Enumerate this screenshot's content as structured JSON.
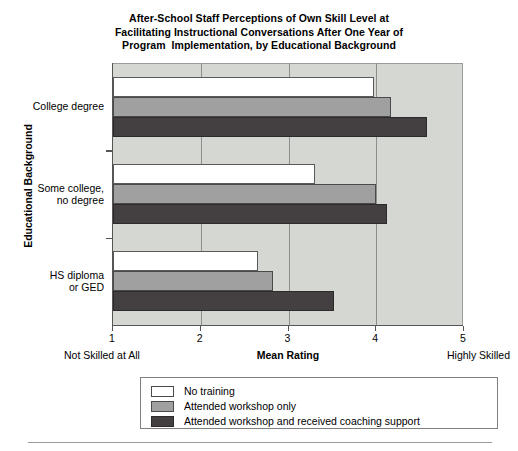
{
  "chart_data": {
    "type": "bar",
    "orientation": "horizontal",
    "title": "After-School Staff Perceptions of Own Skill Level at Facilitating Instructional Conversations After One Year of Program  Implementation, by Educational Background",
    "title_lines": [
      "After-School Staff Perceptions of Own Skill Level at",
      "Facilitating Instructional Conversations After One Year of",
      "Program  Implementation, by Educational Background"
    ],
    "xlabel": "Mean Rating",
    "ylabel": "Educational Background",
    "xlim": [
      1,
      5
    ],
    "xticks": [
      1,
      2,
      3,
      4,
      5
    ],
    "xtick_labels": [
      "1",
      "2",
      "3",
      "4",
      "5"
    ],
    "x_axis_low_anchor": "Not Skilled at All",
    "x_axis_high_anchor": "Highly Skilled",
    "grid": true,
    "legend_position": "below",
    "categories": [
      "College degree",
      "Some college, no degree",
      "HS diploma or GED"
    ],
    "category_lines": [
      [
        "College degree"
      ],
      [
        "Some college,",
        "no degree"
      ],
      [
        "HS diploma",
        "or GED"
      ]
    ],
    "series": [
      {
        "name": "No training",
        "color": "#ffffff",
        "values": [
          3.97,
          3.3,
          2.65
        ]
      },
      {
        "name": "Attended workshop only",
        "color": "#a0a0a0",
        "values": [
          4.17,
          4.0,
          2.82
        ]
      },
      {
        "name": "Attended workshop and received coaching support",
        "color": "#443f40",
        "values": [
          4.58,
          4.12,
          3.52
        ]
      }
    ],
    "plot_background_color": "#d5d7d3",
    "gridline_color": "#8d8f8c"
  },
  "legend": {
    "items": [
      {
        "label": "No training",
        "swatch": "white"
      },
      {
        "label": "Attended workshop only",
        "swatch": "gray"
      },
      {
        "label": "Attended workshop and received coaching support",
        "swatch": "dark"
      }
    ]
  }
}
